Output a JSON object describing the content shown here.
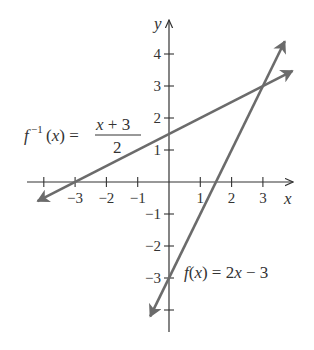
{
  "chart_data": {
    "type": "line",
    "title": "",
    "xlabel": "x",
    "ylabel": "y",
    "xlim": [
      -4,
      4
    ],
    "ylim": [
      -4,
      4
    ],
    "x_ticks": [
      -4,
      -3,
      -2,
      -1,
      1,
      2,
      3
    ],
    "x_tick_labels": [
      "",
      "−3",
      "−2",
      "−1",
      "1",
      "2",
      "3"
    ],
    "y_ticks": [
      -4,
      -3,
      -2,
      -1,
      1,
      2,
      3,
      4
    ],
    "y_tick_labels": [
      "",
      "−3",
      "−2",
      "−1",
      "1",
      "2",
      "3",
      "4"
    ],
    "grid": false,
    "legend": "none (inline labels)",
    "series": [
      {
        "name": "f(x) = 2x − 3",
        "label_text": "f(x) = 2x − 3",
        "slope": 2,
        "intercept": -3,
        "x": [
          -0.6,
          3.7
        ],
        "y": [
          -4.2,
          4.4
        ],
        "arrows": "both",
        "color": "#6b6b6b"
      },
      {
        "name": "f⁻¹(x) = (x + 3)/2",
        "label_text": "f⁻¹(x) = (x + 3)/2",
        "slope": 0.5,
        "intercept": 1.5,
        "x": [
          -4.2,
          3.95
        ],
        "y": [
          -0.6,
          3.475
        ],
        "arrows": "both",
        "color": "#6b6b6b"
      }
    ],
    "annotations": [
      {
        "text": "f⁻¹(x) = (x + 3)/2",
        "near": [
          -4.5,
          1.5
        ]
      },
      {
        "text": "f(x) = 2x − 3",
        "near": [
          0.5,
          -3
        ]
      }
    ],
    "intersection": [
      3,
      3
    ]
  },
  "labels": {
    "x_axis": "x",
    "y_axis": "y",
    "finv_lhs": "f",
    "finv_sup": "−1",
    "finv_paren": "(x) =",
    "finv_num": "x + 3",
    "finv_den": "2",
    "f_eq_f": "f",
    "f_eq_rest": "(x) = 2x − 3"
  },
  "colors": {
    "axis": "#333333",
    "line": "#6b6b6b",
    "background": "#ffffff"
  }
}
